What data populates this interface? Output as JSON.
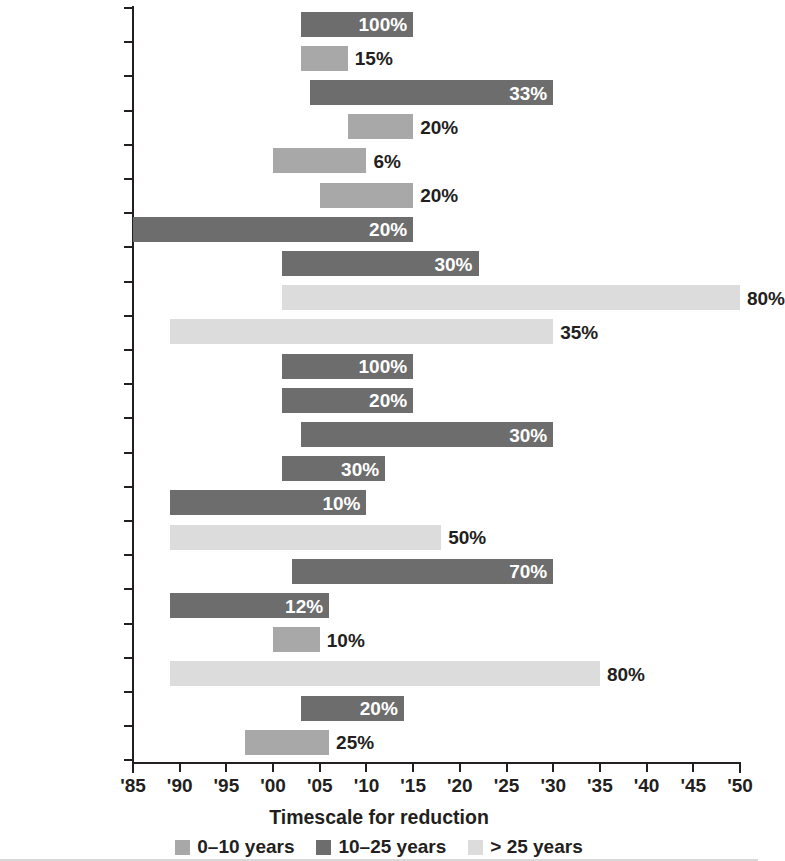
{
  "chart_data": {
    "type": "bar",
    "orientation": "horizontal",
    "subtype": "range-bar (gantt / timeline)",
    "title": "",
    "xlabel": "Timescale for reduction",
    "ylabel": "",
    "xlim": [
      1985,
      2050
    ],
    "x_tick_values": [
      1985,
      1990,
      1995,
      2000,
      2005,
      2010,
      2015,
      2020,
      2025,
      2030,
      2035,
      2040,
      2045,
      2050
    ],
    "x_tick_labels": [
      "'85",
      "'90",
      "'95",
      "'00",
      "'05",
      "'10",
      "'15",
      "'20",
      "'25",
      "'30",
      "'35",
      "'40",
      "'45",
      "'50"
    ],
    "grid": false,
    "legend_position": "bottom",
    "legend": [
      {
        "label": "0–10 years",
        "color": "#a8a8a8",
        "key": "mid"
      },
      {
        "label": "10–25 years",
        "color": "#6d6d6d",
        "key": "dark"
      },
      {
        "label": "> 25 years",
        "color": "#dcdcdc",
        "key": "light"
      }
    ],
    "categories": [
      "Austin",
      "Bangkok",
      "Buenos Aires",
      "Changwon",
      "Chicago",
      "Copenhagen",
      "Heidelberg",
      "Jakarta",
      "London",
      "Los Angeles",
      "Melbourne",
      "Milan",
      "New Orleans",
      "New York",
      "Portland",
      "Rotterdam",
      "Sydney",
      "Philadelphia",
      "Tokyo",
      "Toronto",
      "Warsaw",
      "Yokohama"
    ],
    "bars": [
      {
        "category": "Austin",
        "label_html": "Austin",
        "start": 2003,
        "end": 2015,
        "value": "100%",
        "series": "dark",
        "label_inside": true
      },
      {
        "category": "Bangkok",
        "label_html": "Bangkok",
        "start": 2003,
        "end": 2008,
        "value": "15%",
        "series": "mid",
        "label_inside": false
      },
      {
        "category": "Buenos Aires",
        "label_html": "Buenos Aires",
        "start": 2004,
        "end": 2030,
        "value": "33%",
        "series": "dark",
        "label_inside": true
      },
      {
        "category": "Changwon",
        "label_html": "Changwon",
        "start": 2008,
        "end": 2015,
        "value": "20%",
        "series": "mid",
        "label_inside": false
      },
      {
        "category": "Chicago",
        "label_html": "Chicago",
        "start": 2000,
        "end": 2010,
        "value": "6%",
        "series": "mid",
        "label_inside": false
      },
      {
        "category": "Copenhagen",
        "label_html": "Copenhagen",
        "start": 2005,
        "end": 2015,
        "value": "20%",
        "series": "mid",
        "label_inside": false
      },
      {
        "category": "Heidelberg",
        "label_html": "Heidelberg<sup>a</sup>",
        "start": 1985,
        "end": 2015,
        "value": "20%",
        "series": "dark",
        "label_inside": true
      },
      {
        "category": "Jakarta",
        "label_html": "Jakarta",
        "start": 2001,
        "end": 2022,
        "value": "30%",
        "series": "dark",
        "label_inside": true
      },
      {
        "category": "London",
        "label_html": "London",
        "start": 2001,
        "end": 2050,
        "value": "80%",
        "series": "light",
        "label_inside": false
      },
      {
        "category": "Los Angeles",
        "label_html": "Los Angeles",
        "start": 1989,
        "end": 2030,
        "value": "35%",
        "series": "light",
        "label_inside": false
      },
      {
        "category": "Melbourne",
        "label_html": "Melbourne",
        "start": 2001,
        "end": 2015,
        "value": "100%",
        "series": "dark",
        "label_inside": true
      },
      {
        "category": "Milan",
        "label_html": "Milan",
        "start": 2001,
        "end": 2015,
        "value": "20%",
        "series": "dark",
        "label_inside": true
      },
      {
        "category": "New Orleans",
        "label_html": "New Orleans",
        "start": 2003,
        "end": 2030,
        "value": "30%",
        "series": "dark",
        "label_inside": true
      },
      {
        "category": "New York",
        "label_html": "New York",
        "start": 2001,
        "end": 2012,
        "value": "30%",
        "series": "dark",
        "label_inside": true
      },
      {
        "category": "Portland",
        "label_html": "Portland",
        "start": 1989,
        "end": 2010,
        "value": "10%",
        "series": "dark",
        "label_inside": true
      },
      {
        "category": "Rotterdam",
        "label_html": "Rotterdam",
        "start": 1989,
        "end": 2018,
        "value": "50%",
        "series": "light",
        "label_inside": false
      },
      {
        "category": "Sydney",
        "label_html": "Sydney",
        "start": 2002,
        "end": 2030,
        "value": "70%",
        "series": "dark",
        "label_inside": true
      },
      {
        "category": "Philadelphia",
        "label_html": "Philadelphia",
        "start": 1989,
        "end": 2006,
        "value": "12%",
        "series": "dark",
        "label_inside": true
      },
      {
        "category": "Tokyo",
        "label_html": "Tokyo",
        "start": 2000,
        "end": 2005,
        "value": "10%",
        "series": "mid",
        "label_inside": false
      },
      {
        "category": "Toronto",
        "label_html": "Toronto",
        "start": 1989,
        "end": 2035,
        "value": "80%",
        "series": "light",
        "label_inside": false
      },
      {
        "category": "Warsaw",
        "label_html": "Warsaw",
        "start": 2003,
        "end": 2014,
        "value": "20%",
        "series": "dark",
        "label_inside": true
      },
      {
        "category": "Yokohama",
        "label_html": "Yokohama",
        "start": 1997,
        "end": 2006,
        "value": "25%",
        "series": "mid",
        "label_inside": false
      }
    ],
    "colors": {
      "mid": "#a8a8a8",
      "dark": "#6d6d6d",
      "light": "#dcdcdc",
      "axis": "#231f20",
      "text": "#231f20",
      "inside_label": "#ffffff"
    }
  }
}
